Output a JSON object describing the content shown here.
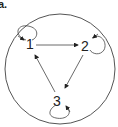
{
  "panel_label": "a.",
  "nodes": [
    {
      "id": "1",
      "label": "1"
    },
    {
      "id": "2",
      "label": "2"
    },
    {
      "id": "3",
      "label": "3"
    }
  ],
  "edges": [
    {
      "from": "1",
      "to": "2"
    },
    {
      "from": "2",
      "to": "3"
    },
    {
      "from": "3",
      "to": "1"
    },
    {
      "from": "1",
      "to": "1"
    },
    {
      "from": "2",
      "to": "2"
    },
    {
      "from": "3",
      "to": "3"
    }
  ],
  "colors": {
    "stroke": "#333333",
    "background": "#ffffff"
  }
}
